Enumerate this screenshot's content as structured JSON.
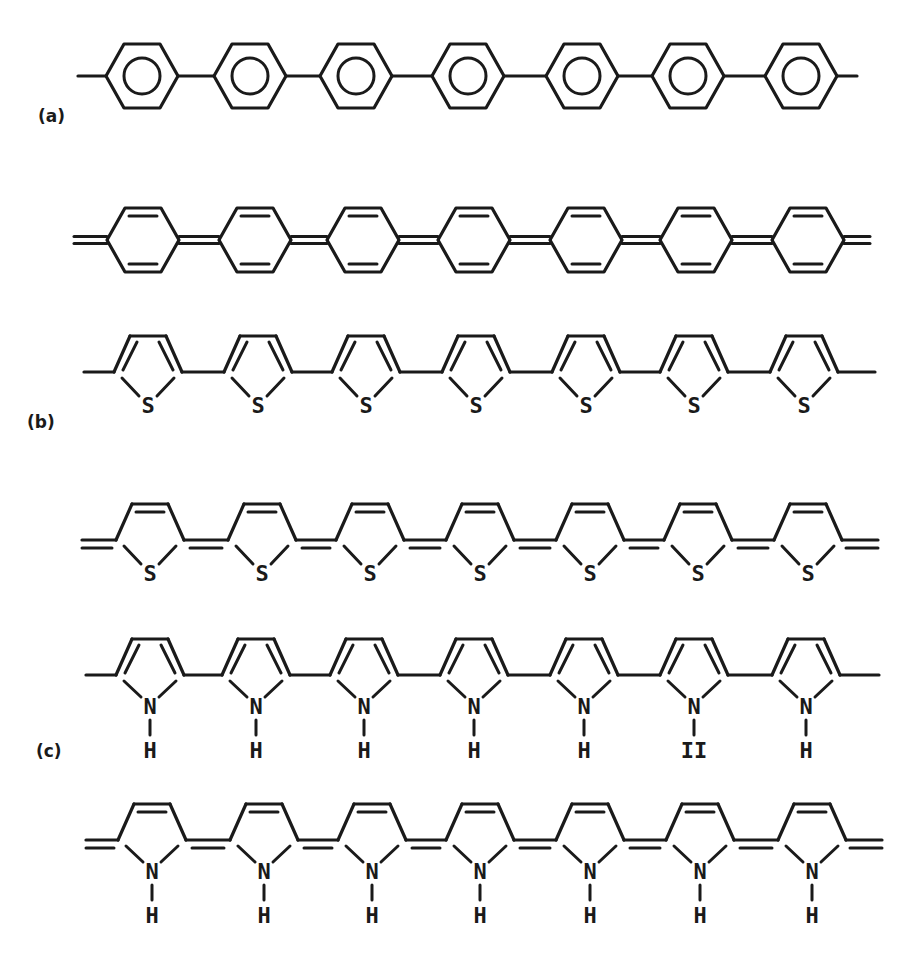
{
  "figure": {
    "panels": [
      {
        "id": "a",
        "label": "(a)",
        "label_pos": [
          38,
          120
        ],
        "description": "Polyparaphenylene"
      },
      {
        "id": "b",
        "label": "(b)",
        "label_pos": [
          27,
          426
        ],
        "description": "Polythiophene"
      },
      {
        "id": "c",
        "label": "(c)",
        "label_pos": [
          36,
          755
        ],
        "description": "Polypyrrole"
      }
    ],
    "chains": [
      {
        "panel": "a",
        "form": "aromatic",
        "ring": "benzene",
        "y": 76,
        "end_bond": "single",
        "x_start": 78,
        "x_end": 857,
        "centers": [
          142,
          250,
          356,
          468,
          582,
          688,
          801
        ]
      },
      {
        "panel": "a",
        "form": "quinoid",
        "ring": "benzene",
        "y": 240,
        "end_bond": "double",
        "x_start": 74,
        "x_end": 870,
        "centers": [
          143,
          255,
          363,
          474,
          586,
          696,
          808
        ]
      },
      {
        "panel": "b",
        "form": "aromatic",
        "ring": "thiophene",
        "heteroatom": "S",
        "y": 372,
        "end_bond": "single",
        "x_start": 84,
        "x_end": 875,
        "centers": [
          148,
          258,
          366,
          476,
          586,
          694,
          804
        ]
      },
      {
        "panel": "b",
        "form": "quinoid",
        "ring": "thiophene",
        "heteroatom": "S",
        "y": 540,
        "end_bond": "double",
        "x_start": 82,
        "x_end": 878,
        "centers": [
          150,
          262,
          370,
          480,
          590,
          698,
          808
        ]
      },
      {
        "panel": "c",
        "form": "aromatic",
        "ring": "pyrrole",
        "heteroatom": "N",
        "substituent": "H",
        "y": 675,
        "end_bond": "single",
        "x_start": 86,
        "x_end": 879,
        "centers": [
          150,
          256,
          364,
          474,
          584,
          694,
          806
        ],
        "substituent_labels": [
          "H",
          "H",
          "H",
          "H",
          "H",
          "II",
          "H"
        ]
      },
      {
        "panel": "c",
        "form": "quinoid",
        "ring": "pyrrole",
        "heteroatom": "N",
        "substituent": "H",
        "y": 840,
        "end_bond": "double",
        "x_start": 86,
        "x_end": 882,
        "centers": [
          152,
          264,
          372,
          480,
          590,
          700,
          812
        ],
        "substituent_labels": [
          "H",
          "H",
          "H",
          "H",
          "H",
          "H",
          "H"
        ]
      }
    ],
    "colors": {
      "ink": "#1a1a1a",
      "background": "#ffffff"
    }
  }
}
